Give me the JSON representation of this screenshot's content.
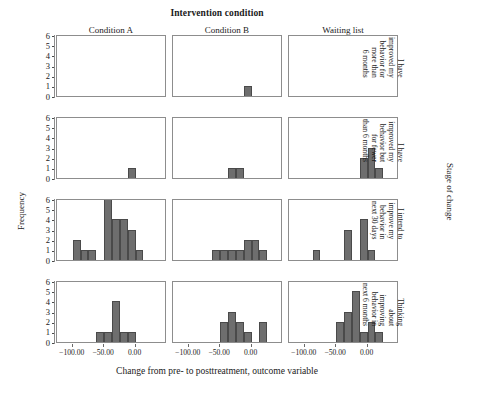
{
  "titles": {
    "column_super": "Intervention condition",
    "row_super": "Stage of change",
    "x_axis": "Change from pre- to posttreatment, outcome variable",
    "y_axis": "Frequency"
  },
  "columns": [
    {
      "label": "Condition A"
    },
    {
      "label": "Condition B"
    },
    {
      "label": "Waiting list"
    }
  ],
  "rows": [
    {
      "label_lines": [
        "I have",
        "improved my",
        "behavior for",
        "more than",
        "6 months"
      ]
    },
    {
      "label_lines": [
        "I have",
        "improved my",
        "behavior but",
        "for fewer",
        "than 6 months"
      ]
    },
    {
      "label_lines": [
        "I intend to",
        "improve my",
        "behavior in",
        "next 30 days"
      ]
    },
    {
      "label_lines": [
        "Thinking",
        "about",
        "improving",
        "behavior in",
        "next 6 months"
      ]
    }
  ],
  "y_ticks": [
    "0",
    "1",
    "2",
    "3",
    "4",
    "5",
    "6"
  ],
  "x_ticks": [
    "-100.00",
    "-50.00",
    "0.00"
  ],
  "colors": {
    "bar_fill": "#6e6e6e",
    "bar_edge": "#4a4a4a",
    "panel_border": "#8d8d8d",
    "text": "#1a1a1a"
  },
  "chart_data": {
    "type": "bar",
    "title": "Intervention condition",
    "subtitle": "Stage of change",
    "xlabel": "Change from pre- to posttreatment, outcome variable",
    "ylabel": "Frequency",
    "ylim": [
      0,
      6
    ],
    "xlim": [
      -125,
      50
    ],
    "xtick_values": [
      -100,
      -50,
      0
    ],
    "ytick_values": [
      0,
      1,
      2,
      3,
      4,
      5,
      6
    ],
    "grid": false,
    "legend": "none",
    "facet_columns": [
      "Condition A",
      "Condition B",
      "Waiting list"
    ],
    "facet_rows": [
      "I have improved my behavior for more than 6 months",
      "I have improved my behavior but for fewer than 6 months",
      "I intend to improve my behavior in next 30 days",
      "Thinking about improving behavior in next 6 months"
    ],
    "bin_width": 12.5,
    "panels": [
      {
        "row": "I have improved my behavior for more than 6 months",
        "column": "Condition A",
        "bins": [],
        "values": []
      },
      {
        "row": "I have improved my behavior for more than 6 months",
        "column": "Condition B",
        "bins": [
          -12.5
        ],
        "values": [
          1
        ]
      },
      {
        "row": "I have improved my behavior for more than 6 months",
        "column": "Waiting list",
        "bins": [],
        "values": []
      },
      {
        "row": "I have improved my behavior but for fewer than 6 months",
        "column": "Condition A",
        "bins": [
          -12.5
        ],
        "values": [
          1
        ]
      },
      {
        "row": "I have improved my behavior but for fewer than 6 months",
        "column": "Condition B",
        "bins": [
          -37.5,
          -25.0
        ],
        "values": [
          1,
          1
        ]
      },
      {
        "row": "I have improved my behavior but for fewer than 6 months",
        "column": "Waiting list",
        "bins": [
          -12.5,
          0.0,
          12.5
        ],
        "values": [
          2,
          3,
          1
        ]
      },
      {
        "row": "I intend to improve my behavior in next 30 days",
        "column": "Condition A",
        "bins": [
          -100.0,
          -87.5,
          -75.0,
          -50.0,
          -37.5,
          -25.0,
          -12.5,
          0.0
        ],
        "values": [
          2,
          1,
          1,
          6,
          4,
          4,
          3,
          1
        ]
      },
      {
        "row": "I intend to improve my behavior in next 30 days",
        "column": "Condition B",
        "bins": [
          -62.5,
          -50.0,
          -37.5,
          -25.0,
          -12.5,
          0.0,
          12.5
        ],
        "values": [
          1,
          1,
          1,
          1,
          2,
          2,
          1
        ]
      },
      {
        "row": "I intend to improve my behavior in next 30 days",
        "column": "Waiting list",
        "bins": [
          -87.5,
          -37.5,
          -12.5,
          0.0
        ],
        "values": [
          1,
          3,
          4,
          1
        ]
      },
      {
        "row": "Thinking about improving behavior in next 6 months",
        "column": "Condition A",
        "bins": [
          -62.5,
          -50.0,
          -37.5,
          -25.0,
          -12.5
        ],
        "values": [
          1,
          1,
          4,
          1,
          1
        ]
      },
      {
        "row": "Thinking about improving behavior in next 6 months",
        "column": "Condition B",
        "bins": [
          -50.0,
          -37.5,
          -25.0,
          -12.5,
          12.5
        ],
        "values": [
          2,
          3,
          2,
          1,
          2
        ]
      },
      {
        "row": "Thinking about improving behavior in next 6 months",
        "column": "Waiting list",
        "bins": [
          -50.0,
          -37.5,
          -25.0,
          -12.5,
          0.0,
          12.5
        ],
        "values": [
          2,
          3,
          5,
          1,
          2,
          1
        ]
      }
    ]
  }
}
